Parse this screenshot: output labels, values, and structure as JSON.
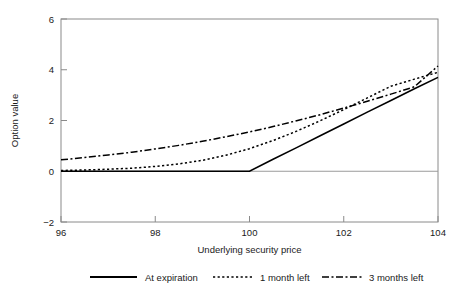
{
  "chart_data": {
    "type": "line",
    "title": "",
    "xlabel": "Underlying security price",
    "ylabel": "Option value",
    "xlim": [
      96,
      104
    ],
    "ylim": [
      -2,
      6
    ],
    "xticks": [
      96,
      98,
      100,
      102,
      104
    ],
    "yticks": [
      6,
      4,
      2,
      0,
      -2
    ],
    "xtick_labels": [
      "96",
      "98",
      "100",
      "102",
      "104"
    ],
    "ytick_labels": [
      "6",
      "4",
      "2",
      "0",
      "-2"
    ],
    "grid": false,
    "legend_position": "below-bottom",
    "zero_line": 0,
    "x": [
      96,
      96.5,
      97,
      97.5,
      98,
      98.5,
      99,
      99.5,
      100,
      100.5,
      101,
      101.5,
      102,
      102.5,
      103,
      103.5,
      104
    ],
    "series": [
      {
        "name": "At expiration",
        "style": "solid",
        "color": "#000000",
        "values": [
          0,
          0,
          0,
          0,
          0,
          0,
          0,
          0,
          0,
          0.47,
          0.93,
          1.4,
          1.86,
          2.33,
          2.79,
          3.25,
          3.7
        ]
      },
      {
        "name": "1 month left",
        "style": "dotted",
        "color": "#000000",
        "values": [
          0.03,
          0.05,
          0.08,
          0.12,
          0.19,
          0.29,
          0.43,
          0.63,
          0.89,
          1.21,
          1.58,
          1.99,
          2.43,
          2.89,
          3.35,
          3.63,
          3.9
        ]
      },
      {
        "name": "3 months left",
        "style": "dash-dot",
        "color": "#000000",
        "values": [
          0.45,
          0.54,
          0.64,
          0.75,
          0.88,
          1.02,
          1.18,
          1.36,
          1.55,
          1.76,
          1.99,
          2.23,
          2.49,
          2.76,
          3.04,
          3.33,
          4.15
        ]
      }
    ]
  },
  "axes": {
    "y_title": "Option value",
    "x_title": "Underlying security price",
    "x_tick_labels": [
      "96",
      "98",
      "100",
      "102",
      "104"
    ],
    "y_tick_labels": [
      "6",
      "4",
      "2",
      "0",
      "−2"
    ]
  },
  "legend": {
    "items": [
      {
        "label": "At expiration",
        "style": "solid"
      },
      {
        "label": "1 month left",
        "style": "dotted"
      },
      {
        "label": "3 months left",
        "style": "dash-dot"
      }
    ]
  }
}
